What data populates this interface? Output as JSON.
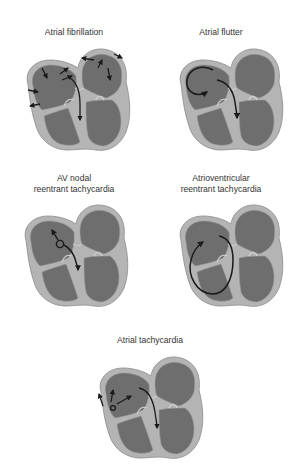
{
  "figure": {
    "colors": {
      "background": "#ffffff",
      "wall": "#b4b4b4",
      "wall_outline": "#8a8a8a",
      "chamber": "#6e6e6e",
      "arrow": "#1a1a1a",
      "text": "#333333"
    },
    "panels": [
      {
        "id": "atrial-fibrillation",
        "title_lines": [
          "Atrial fibrillation"
        ],
        "pattern": "multiple-chaotic-arrows"
      },
      {
        "id": "atrial-flutter",
        "title_lines": [
          "Atrial flutter"
        ],
        "pattern": "macro-reentrant-loop-right-atrium"
      },
      {
        "id": "av-nodal-reentrant-tachycardia",
        "title_lines": [
          "AV nodal",
          "reentrant tachycardia"
        ],
        "pattern": "small-loop-at-av-node"
      },
      {
        "id": "atrioventricular-reentrant-tachycardia",
        "title_lines": [
          "Atrioventricular",
          "reentrant tachycardia"
        ],
        "pattern": "loop-through-accessory-pathway"
      },
      {
        "id": "atrial-tachycardia",
        "title_lines": [
          "Atrial tachycardia"
        ],
        "pattern": "focal-origin-with-radiating-arrows"
      }
    ]
  }
}
